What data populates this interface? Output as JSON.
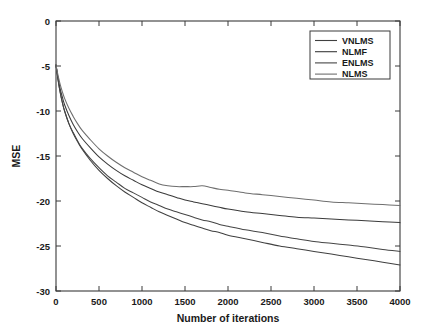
{
  "chart_data": {
    "type": "line",
    "title": "",
    "xlabel": "Number of iterations",
    "ylabel": "MSE",
    "xlim": [
      0,
      4000
    ],
    "ylim": [
      -30,
      0
    ],
    "xticks": [
      0,
      500,
      1000,
      1500,
      2000,
      2500,
      3000,
      3500,
      4000
    ],
    "xtick_labels": [
      "0",
      "500",
      "1000",
      "1500",
      "2000",
      "2500",
      "3000",
      "3500",
      "4000"
    ],
    "yticks": [
      0,
      -5,
      -10,
      -15,
      -20,
      -25,
      -30
    ],
    "ytick_labels": [
      "0",
      "-5",
      "-10",
      "-15",
      "-20",
      "-25",
      "-30"
    ],
    "grid": false,
    "legend_position": "top-right",
    "x": [
      0,
      25,
      50,
      75,
      100,
      150,
      200,
      250,
      300,
      400,
      500,
      600,
      700,
      800,
      900,
      1000,
      1100,
      1200,
      1300,
      1400,
      1500,
      1600,
      1700,
      1800,
      1900,
      2000,
      2200,
      2400,
      2600,
      2800,
      3000,
      3200,
      3400,
      3600,
      3800,
      4000
    ],
    "series": [
      {
        "name": "VNLMS",
        "color": "#404040",
        "values": [
          -4.9,
          -6.6,
          -8.0,
          -9.1,
          -10.0,
          -11.4,
          -12.5,
          -13.4,
          -14.2,
          -15.5,
          -16.6,
          -17.5,
          -18.3,
          -19.0,
          -19.6,
          -20.2,
          -20.7,
          -21.2,
          -21.6,
          -22.0,
          -22.4,
          -22.7,
          -23.0,
          -23.3,
          -23.5,
          -23.8,
          -24.2,
          -24.6,
          -25.0,
          -25.3,
          -25.6,
          -25.9,
          -26.2,
          -26.5,
          -26.8,
          -27.1
        ]
      },
      {
        "name": "NLMF",
        "color": "#3a3a3a",
        "values": [
          -4.9,
          -6.4,
          -7.6,
          -8.5,
          -9.3,
          -10.5,
          -11.5,
          -12.3,
          -13.0,
          -14.1,
          -15.1,
          -15.9,
          -16.6,
          -17.2,
          -17.7,
          -18.2,
          -18.6,
          -19.0,
          -19.3,
          -19.6,
          -19.9,
          -20.1,
          -20.3,
          -20.5,
          -20.7,
          -20.9,
          -21.2,
          -21.4,
          -21.6,
          -21.8,
          -21.9,
          -22.0,
          -22.1,
          -22.2,
          -22.3,
          -22.4
        ]
      },
      {
        "name": "ENLMS",
        "color": "#454545",
        "values": [
          -4.9,
          -6.6,
          -8.0,
          -9.1,
          -10.0,
          -11.4,
          -12.4,
          -13.3,
          -14.1,
          -15.3,
          -16.3,
          -17.2,
          -17.9,
          -18.6,
          -19.1,
          -19.6,
          -20.1,
          -20.5,
          -20.9,
          -21.2,
          -21.5,
          -21.8,
          -22.1,
          -22.3,
          -22.6,
          -22.8,
          -23.2,
          -23.5,
          -23.9,
          -24.2,
          -24.5,
          -24.7,
          -24.9,
          -25.1,
          -25.4,
          -25.6
        ]
      },
      {
        "name": "NLMS",
        "color": "#6e6e6e",
        "values": [
          -4.9,
          -6.1,
          -7.1,
          -7.9,
          -8.6,
          -9.7,
          -10.6,
          -11.4,
          -12.1,
          -13.2,
          -14.2,
          -15.0,
          -15.7,
          -16.3,
          -16.8,
          -17.3,
          -17.7,
          -18.1,
          -18.3,
          -18.4,
          -18.4,
          -18.4,
          -18.3,
          -18.5,
          -18.7,
          -18.8,
          -19.1,
          -19.3,
          -19.5,
          -19.7,
          -19.9,
          -20.1,
          -20.2,
          -20.3,
          -20.4,
          -20.5
        ]
      }
    ]
  },
  "legend": {
    "entries": [
      {
        "label": "VNLMS"
      },
      {
        "label": "NLMF"
      },
      {
        "label": "ENLMS"
      },
      {
        "label": "NLMS"
      }
    ]
  }
}
